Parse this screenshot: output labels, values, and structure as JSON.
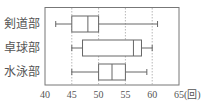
{
  "chart_data": {
    "type": "boxplot",
    "title": "",
    "xlabel": "",
    "unit_label": "(回)",
    "xlim": [
      40,
      65
    ],
    "xticks": [
      40,
      45,
      50,
      55,
      60,
      65
    ],
    "xtick_labels": [
      "40",
      "45",
      "50",
      "55",
      "60",
      "65(回)"
    ],
    "grid": {
      "vertical_dashed_at": [
        45,
        50,
        55,
        60
      ]
    },
    "orientation": "horizontal",
    "categories": [
      "剣道部",
      "卓球部",
      "水泳部"
    ],
    "series": [
      {
        "name": "剣道部",
        "min": 42,
        "q1": 45,
        "median": 48,
        "q3": 50,
        "max": 61
      },
      {
        "name": "卓球部",
        "min": 45,
        "q1": 47,
        "median": 56.5,
        "q3": 58,
        "max": 60
      },
      {
        "name": "水泳部",
        "min": 45,
        "q1": 50,
        "median": 52.5,
        "q3": 55,
        "max": 59
      }
    ],
    "colors": {
      "line": "#666666",
      "grid": "#999999",
      "frame": "#777777"
    }
  }
}
